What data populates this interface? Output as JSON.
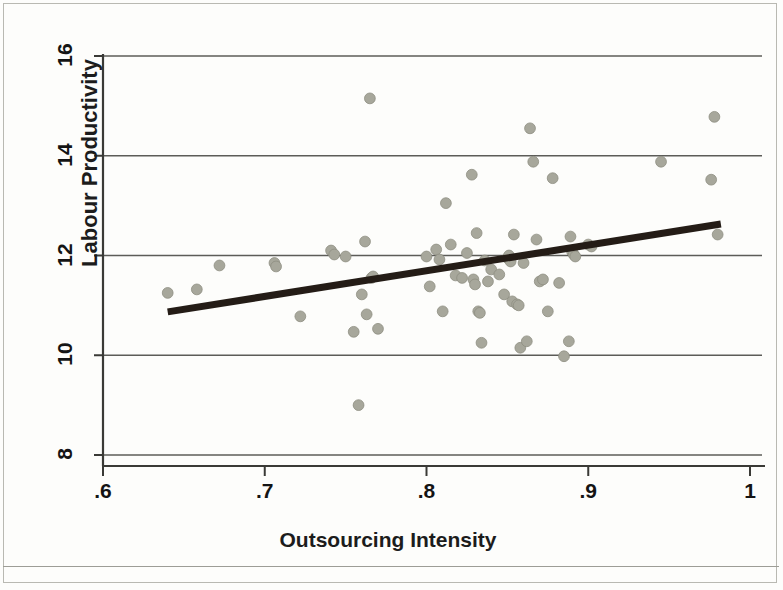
{
  "figure": {
    "kind": "scatter-plot-with-fit-line",
    "background_color": "#fdfdfb",
    "border_color": "#b9b9b2"
  },
  "axes": {
    "y_axis_title": "Labour Productivity",
    "x_axis_title": "Outsourcing Intensity",
    "y_tick_labels": [
      "8",
      "10",
      "12",
      "14",
      "16"
    ],
    "x_tick_labels": [
      ".6",
      ".7",
      ".8",
      ".9",
      "1"
    ]
  },
  "style": {
    "marker_color": "#a7a79b",
    "marker_edge_color": "#8e8e82",
    "line_color": "#241c16",
    "grid_color": "#5c5c58",
    "axis_color": "#3a3a36"
  },
  "chart_data": {
    "type": "scatter",
    "title": "",
    "xlabel": "Outsourcing Intensity",
    "ylabel": "Labour Productivity",
    "xlim": [
      0.6,
      1.0
    ],
    "ylim": [
      8,
      16
    ],
    "xticks": [
      0.6,
      0.7,
      0.8,
      0.9,
      1.0
    ],
    "yticks": [
      8,
      10,
      12,
      14,
      16
    ],
    "xtick_labels": [
      ".6",
      ".7",
      ".8",
      ".9",
      "1"
    ],
    "ytick_labels": [
      "8",
      "10",
      "12",
      "14",
      "16"
    ],
    "grid": "horizontal",
    "legend": null,
    "series": [
      {
        "name": "observations",
        "type": "scatter",
        "marker": "circle",
        "color": "#a7a79b",
        "points": [
          [
            0.64,
            11.25
          ],
          [
            0.658,
            11.32
          ],
          [
            0.672,
            11.8
          ],
          [
            0.706,
            11.85
          ],
          [
            0.707,
            11.78
          ],
          [
            0.722,
            10.78
          ],
          [
            0.741,
            12.1
          ],
          [
            0.743,
            12.02
          ],
          [
            0.75,
            11.98
          ],
          [
            0.755,
            10.47
          ],
          [
            0.76,
            11.22
          ],
          [
            0.762,
            12.28
          ],
          [
            0.763,
            10.82
          ],
          [
            0.765,
            15.15
          ],
          [
            0.766,
            11.55
          ],
          [
            0.767,
            11.58
          ],
          [
            0.758,
            9.0
          ],
          [
            0.77,
            10.53
          ],
          [
            0.8,
            11.98
          ],
          [
            0.802,
            11.38
          ],
          [
            0.806,
            12.12
          ],
          [
            0.808,
            11.92
          ],
          [
            0.81,
            10.88
          ],
          [
            0.812,
            13.05
          ],
          [
            0.815,
            12.22
          ],
          [
            0.818,
            11.6
          ],
          [
            0.822,
            11.55
          ],
          [
            0.825,
            12.05
          ],
          [
            0.828,
            13.62
          ],
          [
            0.829,
            11.52
          ],
          [
            0.83,
            11.42
          ],
          [
            0.831,
            12.45
          ],
          [
            0.832,
            10.88
          ],
          [
            0.833,
            10.85
          ],
          [
            0.834,
            10.25
          ],
          [
            0.836,
            11.9
          ],
          [
            0.838,
            11.48
          ],
          [
            0.84,
            11.72
          ],
          [
            0.845,
            11.62
          ],
          [
            0.848,
            11.22
          ],
          [
            0.85,
            11.95
          ],
          [
            0.851,
            12.0
          ],
          [
            0.852,
            11.88
          ],
          [
            0.853,
            11.08
          ],
          [
            0.854,
            12.42
          ],
          [
            0.856,
            11.02
          ],
          [
            0.857,
            11.0
          ],
          [
            0.858,
            10.15
          ],
          [
            0.86,
            11.85
          ],
          [
            0.862,
            10.28
          ],
          [
            0.864,
            14.55
          ],
          [
            0.866,
            13.88
          ],
          [
            0.868,
            12.32
          ],
          [
            0.87,
            11.48
          ],
          [
            0.872,
            11.52
          ],
          [
            0.875,
            10.88
          ],
          [
            0.878,
            13.55
          ],
          [
            0.882,
            11.45
          ],
          [
            0.885,
            9.98
          ],
          [
            0.888,
            10.28
          ],
          [
            0.889,
            12.38
          ],
          [
            0.89,
            12.08
          ],
          [
            0.891,
            12.02
          ],
          [
            0.892,
            11.98
          ],
          [
            0.9,
            12.22
          ],
          [
            0.902,
            12.18
          ],
          [
            0.945,
            13.88
          ],
          [
            0.976,
            13.52
          ],
          [
            0.978,
            14.78
          ],
          [
            0.98,
            12.42
          ]
        ]
      },
      {
        "name": "fitted regression line",
        "type": "line",
        "color": "#241c16",
        "x": [
          0.64,
          0.982
        ],
        "y": [
          10.87,
          12.63
        ]
      }
    ]
  }
}
